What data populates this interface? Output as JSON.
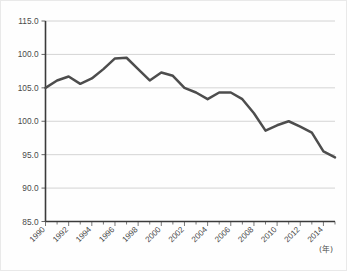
{
  "chart_data": {
    "type": "line",
    "title": "",
    "xlabel": "(年)",
    "ylabel": "",
    "xlim": [
      1990,
      2015
    ],
    "ylim": [
      85.0,
      115.0
    ],
    "grid": true,
    "legend": "none",
    "y_ticks": [
      "115.0",
      "100.0",
      "105.0",
      "100.0",
      "95.0",
      "90.0",
      "85.0"
    ],
    "y_tick_values": [
      115.0,
      110.0,
      105.0,
      100.0,
      95.0,
      90.0,
      85.0
    ],
    "x_ticks": [
      "1990",
      "1992",
      "1994",
      "1996",
      "1998",
      "2000",
      "2002",
      "2004",
      "2006",
      "2008",
      "2010",
      "2012",
      "2014"
    ],
    "x_tick_values": [
      1990,
      1992,
      1994,
      1996,
      1998,
      2000,
      2002,
      2004,
      2006,
      2008,
      2010,
      2012,
      2014
    ],
    "x": [
      1990,
      1991,
      1992,
      1993,
      1994,
      1995,
      1996,
      1997,
      1998,
      1999,
      2000,
      2001,
      2002,
      2003,
      2004,
      2005,
      2006,
      2007,
      2008,
      2009,
      2010,
      2011,
      2012,
      2013,
      2014,
      2015
    ],
    "series": [
      {
        "name": "index",
        "values": [
          105.0,
          106.1,
          106.7,
          105.6,
          106.4,
          107.8,
          109.4,
          109.5,
          107.8,
          106.1,
          107.3,
          106.8,
          105.0,
          104.3,
          103.3,
          104.3,
          104.3,
          103.3,
          101.2,
          98.6,
          99.4,
          100.0,
          99.2,
          98.3,
          95.5,
          94.6
        ]
      }
    ],
    "colors": {
      "line": "#4d4d4d",
      "grid": "#c9c9c9",
      "axis": "#3a3a3a",
      "text": "#4a4a4a",
      "background": "#fefefe"
    }
  }
}
